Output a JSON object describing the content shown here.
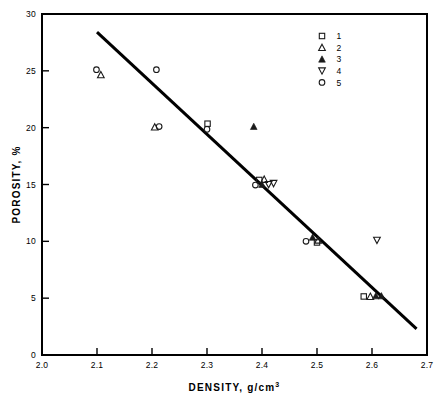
{
  "chart_data": {
    "type": "scatter",
    "title": "",
    "xlabel": "DENSITY,  g/cm3",
    "xlabel_main": "DENSITY,  g/cm",
    "xlabel_sup": "3",
    "ylabel": "POROSITY, %",
    "xlim": [
      2.0,
      2.7
    ],
    "ylim": [
      0,
      30
    ],
    "xticks": [
      "2.0",
      "2.1",
      "2.2",
      "2.3",
      "2.4",
      "2.5",
      "2.6",
      "2.7"
    ],
    "xtick_values": [
      2.0,
      2.1,
      2.2,
      2.3,
      2.4,
      2.5,
      2.6,
      2.7
    ],
    "yticks": [
      "0",
      "5",
      "10",
      "15",
      "20",
      "25",
      "30"
    ],
    "ytick_values": [
      0,
      5,
      10,
      15,
      20,
      25,
      30
    ],
    "grid": false,
    "legend_position": "top-right",
    "legend": [
      {
        "label": "1",
        "marker": "open-square"
      },
      {
        "label": "2",
        "marker": "open-triangle-up"
      },
      {
        "label": "3",
        "marker": "filled-triangle-up"
      },
      {
        "label": "4",
        "marker": "open-triangle-down"
      },
      {
        "label": "5",
        "marker": "open-circle"
      }
    ],
    "series": [
      {
        "name": "1",
        "marker": "open-square",
        "points": [
          {
            "x": 2.301,
            "y": 20.35
          },
          {
            "x": 2.395,
            "y": 15.4
          },
          {
            "x": 2.5,
            "y": 9.9
          },
          {
            "x": 2.585,
            "y": 5.15
          }
        ]
      },
      {
        "name": "2",
        "marker": "open-triangle-up",
        "points": [
          {
            "x": 2.107,
            "y": 24.65
          },
          {
            "x": 2.205,
            "y": 20.05
          },
          {
            "x": 2.404,
            "y": 15.45
          },
          {
            "x": 2.502,
            "y": 10.1
          },
          {
            "x": 2.597,
            "y": 5.15
          }
        ]
      },
      {
        "name": "3",
        "marker": "filled-triangle-up",
        "points": [
          {
            "x": 2.385,
            "y": 20.1
          },
          {
            "x": 2.4,
            "y": 15.0
          },
          {
            "x": 2.492,
            "y": 10.35
          },
          {
            "x": 2.607,
            "y": 5.2
          },
          {
            "x": 2.617,
            "y": 5.2
          }
        ]
      },
      {
        "name": "4",
        "marker": "open-triangle-down",
        "points": [
          {
            "x": 2.412,
            "y": 15.0
          },
          {
            "x": 2.421,
            "y": 15.1
          },
          {
            "x": 2.609,
            "y": 10.1
          }
        ]
      },
      {
        "name": "5",
        "marker": "open-circle",
        "points": [
          {
            "x": 2.099,
            "y": 25.1
          },
          {
            "x": 2.208,
            "y": 25.1
          },
          {
            "x": 2.213,
            "y": 20.1
          },
          {
            "x": 2.3,
            "y": 19.85
          },
          {
            "x": 2.388,
            "y": 14.95
          },
          {
            "x": 2.48,
            "y": 10.0
          }
        ]
      }
    ],
    "trend_line": {
      "label": "regression-line",
      "x1": 2.1,
      "y1": 28.4,
      "x2": 2.681,
      "y2": 2.3
    }
  }
}
